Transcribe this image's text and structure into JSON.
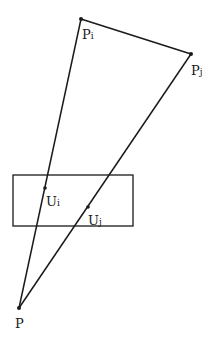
{
  "diagram": {
    "points": {
      "Pi": {
        "label_main": "P",
        "label_sub": "i",
        "x": 81,
        "y": 19
      },
      "Pj": {
        "label_main": "P",
        "label_sub": "j",
        "x": 191,
        "y": 54
      },
      "P": {
        "label_main": "P",
        "label_sub": "",
        "x": 19,
        "y": 308
      },
      "Ui": {
        "label_main": "U",
        "label_sub": "i",
        "x": 45,
        "y": 188
      },
      "Uj": {
        "label_main": "U",
        "label_sub": "j",
        "x": 88,
        "y": 207
      }
    },
    "rectangle": {
      "x": 13,
      "y": 175,
      "width": 120,
      "height": 51
    },
    "colors": {
      "line": "#1a1a1a",
      "background": "#ffffff"
    }
  }
}
